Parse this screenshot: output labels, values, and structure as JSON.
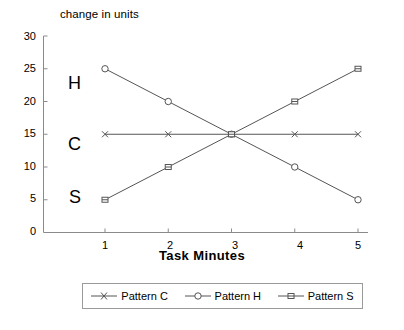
{
  "chart_data": {
    "type": "line",
    "title": "",
    "xlabel": "Task Minutes",
    "ylabel": "change in units",
    "x": [
      1,
      2,
      3,
      4,
      5
    ],
    "xtick_labels": [
      "1",
      "2",
      "3",
      "4",
      "5"
    ],
    "ytick_labels": [
      "0",
      "5",
      "10",
      "15",
      "20",
      "25",
      "30"
    ],
    "yticks": [
      0,
      5,
      10,
      15,
      20,
      25,
      30
    ],
    "xlim": [
      0.5,
      5.5
    ],
    "ylim": [
      0,
      30
    ],
    "grid": false,
    "legend_position": "bottom",
    "series": [
      {
        "name": "Pattern C",
        "values": [
          15,
          15,
          15,
          15,
          15
        ],
        "marker": "x",
        "color": "#555555"
      },
      {
        "name": "Pattern H",
        "values": [
          25,
          20,
          15,
          10,
          5
        ],
        "marker": "circle",
        "color": "#555555"
      },
      {
        "name": "Pattern S",
        "values": [
          5,
          10,
          15,
          20,
          25
        ],
        "marker": "dash-square",
        "color": "#555555"
      }
    ],
    "annotations": [
      {
        "text": "H",
        "x": 0.62,
        "y": 22.5
      },
      {
        "text": "C",
        "x": 0.62,
        "y": 13.5
      },
      {
        "text": "S",
        "x": 0.62,
        "y": 5.0
      }
    ]
  },
  "axis": {
    "y_title": "change in units",
    "x_title": "Task Minutes",
    "ytick_0": "0",
    "ytick_5": "5",
    "ytick_10": "10",
    "ytick_15": "15",
    "ytick_20": "20",
    "ytick_25": "25",
    "ytick_30": "30",
    "xtick_1": "1",
    "xtick_2": "2",
    "xtick_3": "3",
    "xtick_4": "4",
    "xtick_5": "5"
  },
  "annotations": {
    "h": "H",
    "c": "C",
    "s": "S"
  },
  "legend": {
    "items": [
      {
        "label": "Pattern C"
      },
      {
        "label": "Pattern H"
      },
      {
        "label": "Pattern S"
      }
    ]
  },
  "colors": {
    "line": "#555555",
    "axis": "#8a8a8a",
    "text": "#000000",
    "legend_border": "#9a9a9a",
    "background": "#ffffff"
  }
}
